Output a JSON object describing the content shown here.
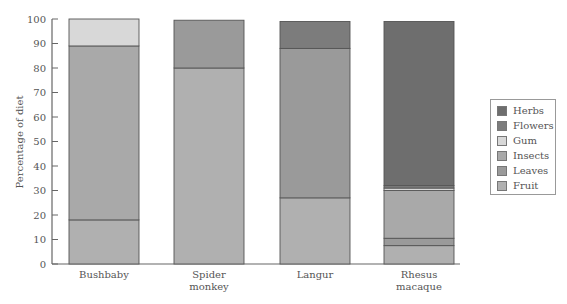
{
  "chart_data": {
    "type": "bar",
    "stacked": true,
    "title": "",
    "xlabel": "",
    "ylabel": "Percentage of diet",
    "ylim": [
      0,
      100
    ],
    "yticks": [
      0,
      10,
      20,
      30,
      40,
      50,
      60,
      70,
      80,
      90,
      100
    ],
    "grid": false,
    "legend_position": "right",
    "categories": [
      "Bushbaby",
      "Spider monkey",
      "Langur",
      "Rhesus macaque"
    ],
    "category_lines": [
      [
        "Bushbaby"
      ],
      [
        "Spider",
        "monkey"
      ],
      [
        "Langur"
      ],
      [
        "Rhesus",
        "macaque"
      ]
    ],
    "series": [
      {
        "name": "Fruit",
        "color": "#b0b0b0",
        "values": [
          18,
          80,
          27,
          7.5
        ]
      },
      {
        "name": "Leaves",
        "color": "#9a9a9a",
        "values": [
          0,
          19.5,
          61,
          3
        ]
      },
      {
        "name": "Insects",
        "color": "#a9a9a9",
        "values": [
          71,
          0,
          0,
          19.5
        ]
      },
      {
        "name": "Gum",
        "color": "#d8d8d8",
        "values": [
          11,
          0,
          0,
          1
        ]
      },
      {
        "name": "Flowers",
        "color": "#7c7c7c",
        "values": [
          0,
          0,
          11,
          1
        ]
      },
      {
        "name": "Herbs",
        "color": "#6e6e6e",
        "values": [
          0,
          0,
          0,
          67
        ]
      }
    ],
    "legend_order": [
      "Herbs",
      "Flowers",
      "Gum",
      "Insects",
      "Leaves",
      "Fruit"
    ]
  }
}
